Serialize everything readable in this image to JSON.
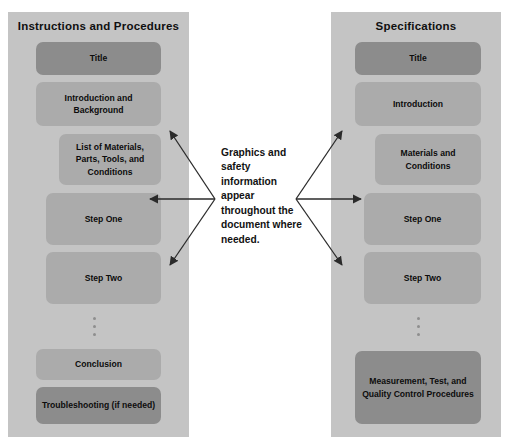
{
  "diagram": {
    "caption": "Graphics and safety information appear throughout the document where needed.",
    "columns": [
      {
        "id": "instructions-and-procedures",
        "title": "Instructions and Procedures",
        "boxes": [
          {
            "label": "Title",
            "shade": "dark"
          },
          {
            "label": "Introduction and Background",
            "shade": "light"
          },
          {
            "label": "List of Materials, Parts, Tools, and Conditions",
            "shade": "light"
          },
          {
            "label": "Step One",
            "shade": "light"
          },
          {
            "label": "Step Two",
            "shade": "light"
          },
          {
            "label": "Conclusion",
            "shade": "light"
          },
          {
            "label": "Troubleshooting (if needed)",
            "shade": "dark"
          }
        ],
        "ellipsis": "⋮"
      },
      {
        "id": "specifications",
        "title": "Specifications",
        "boxes": [
          {
            "label": "Title",
            "shade": "dark"
          },
          {
            "label": "Introduction",
            "shade": "light"
          },
          {
            "label": "Materials and Conditions",
            "shade": "light"
          },
          {
            "label": "Step One",
            "shade": "light"
          },
          {
            "label": "Step Two",
            "shade": "light"
          },
          {
            "label": "Measurement, Test, and Quality Control Procedures",
            "shade": "dark"
          }
        ],
        "ellipsis": "⋮"
      }
    ],
    "colors": {
      "panel_background": "#c4c4c4",
      "box_dark": "#8c8c8c",
      "box_light": "#ababab",
      "text": "#0c0c0c",
      "arrow": "#2b2b2b",
      "page_background": "#ffffff"
    },
    "arrow_count": 6
  }
}
